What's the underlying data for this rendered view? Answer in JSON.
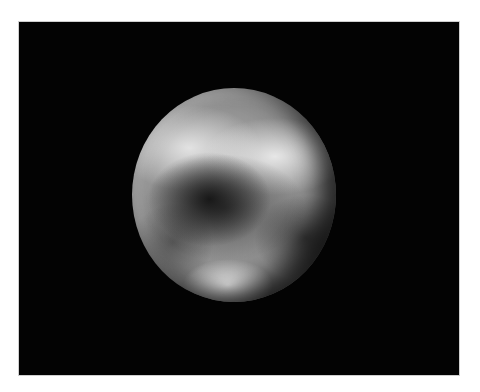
{
  "image": {
    "subject": "planetary-body",
    "description": "Grayscale image of a spherical planetary body (Pluto-like) on a black background with light and dark surface markings",
    "background_color": "#030303",
    "frame_border_color": "#cfcfcf",
    "page_background": "#ffffff"
  }
}
